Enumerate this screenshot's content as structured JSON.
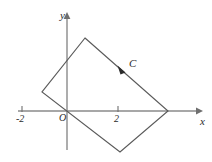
{
  "figure": {
    "type": "vector-field-contour-diagram",
    "background_color": "#ffffff",
    "axes": {
      "x_axis": {
        "label": "x",
        "color": "#8a8a8a",
        "ticks": [
          {
            "label": "-2",
            "value": -2
          },
          {
            "label": "2",
            "value": 2
          }
        ]
      },
      "y_axis": {
        "label": "y",
        "color": "#8a8a8a",
        "ticks": []
      },
      "origin_label": "O"
    },
    "curve": {
      "label": "C",
      "shape": "rectangle",
      "color": "#5a5a5a",
      "orientation": "clockwise",
      "vertices": [
        {
          "x": 85,
          "y": 38
        },
        {
          "x": 168,
          "y": 111
        },
        {
          "x": 120,
          "y": 152
        },
        {
          "x": 42,
          "y": 92
        }
      ],
      "direction_marker": "arrowhead"
    }
  }
}
